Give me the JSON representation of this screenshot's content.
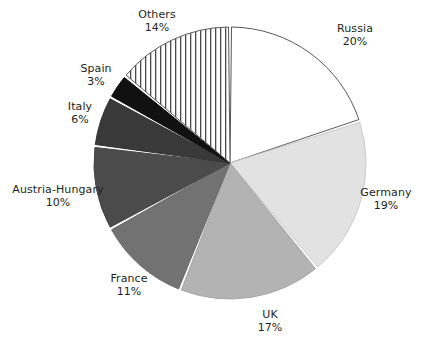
{
  "chart_data": {
    "type": "pie",
    "title": "",
    "subtitle": "",
    "xlabel": "",
    "ylabel": "",
    "legend_position": "none",
    "grid": false,
    "start_angle_deg": 0,
    "direction": "clockwise",
    "unit": "%",
    "categories": [
      "Russia",
      "Germany",
      "UK",
      "France",
      "Austria-Hungary",
      "Italy",
      "Spain",
      "Others"
    ],
    "values": [
      20,
      19,
      17,
      11,
      10,
      6,
      3,
      14
    ],
    "total": 100,
    "slices": [
      {
        "name": "Russia",
        "label": "Russia",
        "value": 20,
        "value_label": "20%",
        "fill": "#ffffff",
        "stroke": "#58585a",
        "pattern": "solid"
      },
      {
        "name": "Germany",
        "label": "Germany",
        "value": 19,
        "value_label": "19%",
        "fill": "#e2e2e2",
        "stroke": "#c9c9c9",
        "pattern": "solid"
      },
      {
        "name": "UK",
        "label": "UK",
        "value": 17,
        "value_label": "17%",
        "fill": "#b3b3b3",
        "stroke": "#a6a6a6",
        "pattern": "solid"
      },
      {
        "name": "France",
        "label": "France",
        "value": 11,
        "value_label": "11%",
        "fill": "#727272",
        "stroke": "#6a6a6a",
        "pattern": "solid"
      },
      {
        "name": "Austria-Hungary",
        "label": "Austria-Hungary",
        "value": 10,
        "value_label": "10%",
        "fill": "#4b4b4b",
        "stroke": "#454545",
        "pattern": "solid"
      },
      {
        "name": "Italy",
        "label": "Italy",
        "value": 6,
        "value_label": "6%",
        "fill": "#393939",
        "stroke": "#333333",
        "pattern": "solid"
      },
      {
        "name": "Spain",
        "label": "Spain",
        "value": 3,
        "value_label": "3%",
        "fill": "#111111",
        "stroke": "#0b0b0b",
        "pattern": "solid"
      },
      {
        "name": "Others",
        "label": "Others",
        "value": 14,
        "value_label": "14%",
        "fill": "#ffffff",
        "stroke": "#58585a",
        "pattern": "vertical-stripes"
      }
    ],
    "geometry": {
      "center_x": 230,
      "center_y": 163,
      "radius": 136,
      "gap_px": 3
    },
    "colors": {
      "background": "#ffffff",
      "label_text": "#231f20",
      "outline": "#58585a",
      "separator": "#ffffff"
    }
  }
}
